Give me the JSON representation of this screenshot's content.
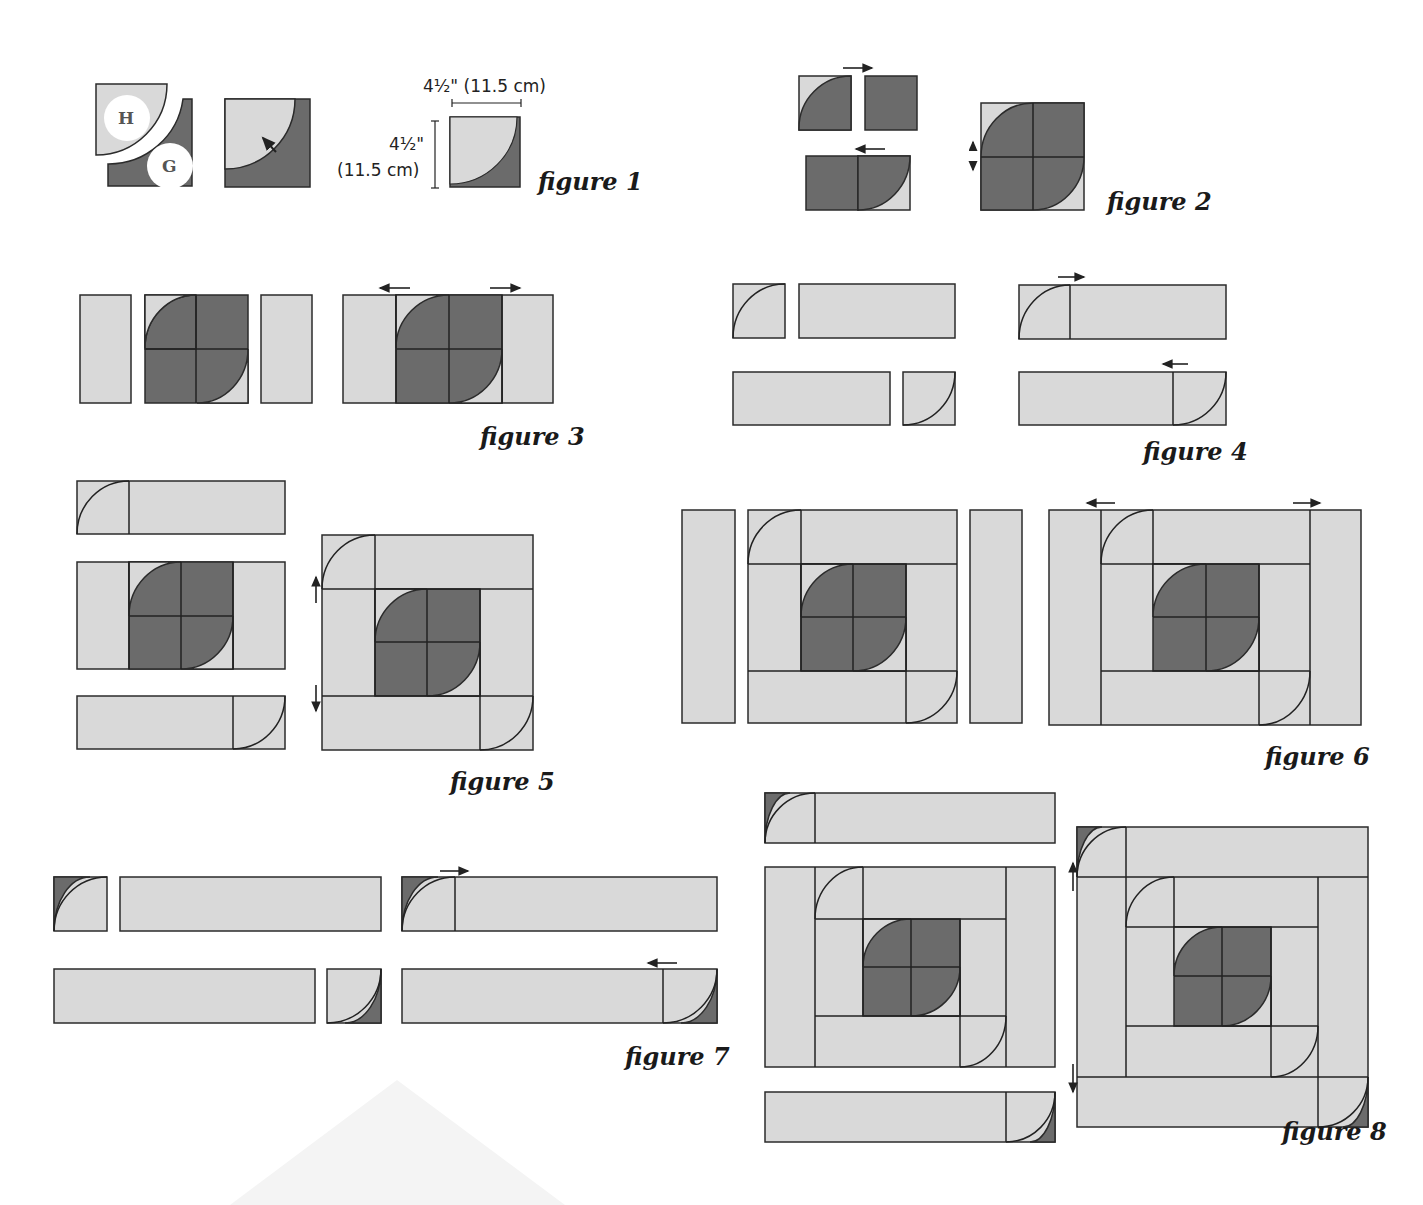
{
  "colors": {
    "light": "#d9d9d9",
    "dark": "#6b6b6b",
    "stroke": "#2b2b2b",
    "ghost": "#f4f4f4"
  },
  "figures": [
    {
      "id": "figure-1",
      "label": "figure 1",
      "label_pos": [
        538,
        190
      ],
      "dimensions": {
        "width_text": "4½\" (11.5 cm)",
        "width_text_pos": [
          423,
          92
        ],
        "height_text_line1": "4½\"",
        "height_text_line1_pos": [
          389,
          150
        ],
        "height_text_line2": "(11.5 cm)",
        "height_text_line2_pos": [
          337,
          176
        ],
        "h_bar": [
          452,
          103,
          521,
          103
        ],
        "v_bar": [
          435,
          121,
          435,
          188
        ]
      },
      "badges": [
        {
          "letter": "H",
          "cx": 127,
          "cy": 118,
          "r": 23
        },
        {
          "letter": "G",
          "cx": 170,
          "cy": 166,
          "r": 23
        }
      ]
    },
    {
      "id": "figure-2",
      "label": "figure 2",
      "label_pos": [
        1107,
        210
      ]
    },
    {
      "id": "figure-3",
      "label": "figure 3",
      "label_pos": [
        480,
        445
      ]
    },
    {
      "id": "figure-4",
      "label": "figure 4",
      "label_pos": [
        1143,
        460
      ]
    },
    {
      "id": "figure-5",
      "label": "figure 5",
      "label_pos": [
        450,
        790
      ]
    },
    {
      "id": "figure-6",
      "label": "figure 6",
      "label_pos": [
        1265,
        765
      ]
    },
    {
      "id": "figure-7",
      "label": "figure 7",
      "label_pos": [
        625,
        1065
      ]
    },
    {
      "id": "figure-8",
      "label": "figure 8",
      "label_pos": [
        1282,
        1140
      ]
    }
  ],
  "rects": [
    [
      80,
      295,
      51,
      108,
      "light"
    ],
    [
      145,
      295,
      103,
      108,
      "dark"
    ],
    [
      261,
      295,
      51,
      108,
      "light"
    ],
    [
      343,
      295,
      210,
      108,
      "light"
    ],
    [
      396,
      295,
      106,
      108,
      "dark"
    ],
    [
      733,
      284,
      52,
      54,
      "light"
    ],
    [
      799,
      284,
      156,
      54,
      "light"
    ],
    [
      1019,
      285,
      207,
      54,
      "light"
    ],
    [
      733,
      372,
      157,
      53,
      "light"
    ],
    [
      903,
      372,
      52,
      53,
      "light"
    ],
    [
      1019,
      372,
      207,
      53,
      "light"
    ],
    [
      77,
      481,
      208,
      53,
      "light"
    ],
    [
      77,
      562,
      208,
      107,
      "light"
    ],
    [
      129,
      562,
      104,
      107,
      "dark"
    ],
    [
      77,
      696,
      208,
      53,
      "light"
    ],
    [
      322,
      535,
      211,
      215,
      "light"
    ],
    [
      375,
      589,
      105,
      107,
      "dark"
    ],
    [
      682,
      510,
      53,
      213,
      "light"
    ],
    [
      748,
      510,
      209,
      213,
      "light"
    ],
    [
      801,
      564,
      105,
      107,
      "dark"
    ],
    [
      970,
      510,
      52,
      213,
      "light"
    ],
    [
      1049,
      510,
      312,
      215,
      "light"
    ],
    [
      1153,
      564,
      106,
      107,
      "dark"
    ],
    [
      54,
      877,
      53,
      54,
      "light"
    ],
    [
      120,
      877,
      261,
      54,
      "light"
    ],
    [
      402,
      877,
      315,
      54,
      "light"
    ],
    [
      54,
      969,
      261,
      54,
      "light"
    ],
    [
      327,
      969,
      54,
      54,
      "light"
    ],
    [
      402,
      969,
      315,
      54,
      "light"
    ],
    [
      765,
      793,
      290,
      50,
      "light"
    ],
    [
      765,
      867,
      290,
      200,
      "light"
    ],
    [
      863,
      919,
      97,
      97,
      "dark"
    ],
    [
      765,
      1092,
      290,
      50,
      "light"
    ],
    [
      1077,
      827,
      291,
      300,
      "light"
    ],
    [
      1174,
      927,
      97,
      99,
      "dark"
    ]
  ],
  "dark_rects_extra": [
    [
      799,
      76,
      52,
      54
    ],
    [
      865,
      76,
      52,
      54
    ],
    [
      806,
      156,
      52,
      54
    ],
    [
      858,
      156,
      52,
      54
    ],
    [
      981,
      103,
      103,
      107
    ],
    [
      225,
      99,
      85,
      88
    ],
    [
      450,
      117,
      70,
      70
    ],
    [
      107,
      99,
      85,
      88
    ]
  ],
  "lines": [
    [
      145,
      349,
      248,
      349
    ],
    [
      196,
      295,
      196,
      403
    ],
    [
      396,
      349,
      502,
      349
    ],
    [
      449,
      295,
      449,
      403
    ],
    [
      396,
      295,
      396,
      403
    ],
    [
      502,
      295,
      502,
      403
    ],
    [
      1070,
      285,
      1070,
      339
    ],
    [
      1173,
      372,
      1173,
      425
    ],
    [
      129,
      481,
      129,
      534
    ],
    [
      129,
      562,
      129,
      669
    ],
    [
      233,
      562,
      233,
      669
    ],
    [
      129,
      616,
      233,
      616
    ],
    [
      181,
      562,
      181,
      669
    ],
    [
      233,
      696,
      233,
      749
    ],
    [
      322,
      589,
      533,
      589
    ],
    [
      322,
      696,
      533,
      696
    ],
    [
      375,
      535,
      375,
      589
    ],
    [
      480,
      589,
      480,
      750
    ],
    [
      375,
      589,
      375,
      696
    ],
    [
      375,
      642,
      480,
      642
    ],
    [
      427,
      589,
      427,
      696
    ],
    [
      748,
      564,
      957,
      564
    ],
    [
      748,
      671,
      957,
      671
    ],
    [
      801,
      510,
      801,
      564
    ],
    [
      906,
      564,
      906,
      723
    ],
    [
      801,
      564,
      801,
      671
    ],
    [
      801,
      617,
      906,
      617
    ],
    [
      853,
      564,
      853,
      671
    ],
    [
      1101,
      510,
      1101,
      725
    ],
    [
      1310,
      510,
      1310,
      725
    ],
    [
      1101,
      564,
      1310,
      564
    ],
    [
      1101,
      671,
      1310,
      671
    ],
    [
      1153,
      510,
      1153,
      564
    ],
    [
      1259,
      564,
      1259,
      725
    ],
    [
      1153,
      617,
      1259,
      617
    ],
    [
      1206,
      564,
      1206,
      671
    ],
    [
      455,
      877,
      455,
      931
    ],
    [
      663,
      969,
      663,
      1023
    ],
    [
      815,
      793,
      815,
      843
    ],
    [
      815,
      867,
      815,
      1067
    ],
    [
      1006,
      867,
      1006,
      1067
    ],
    [
      815,
      919,
      1006,
      919
    ],
    [
      815,
      1016,
      1006,
      1016
    ],
    [
      863,
      867,
      863,
      919
    ],
    [
      960,
      919,
      960,
      1067
    ],
    [
      863,
      919,
      863,
      1016
    ],
    [
      863,
      967,
      960,
      967
    ],
    [
      911,
      919,
      911,
      1016
    ],
    [
      1006,
      1092,
      1006,
      1142
    ],
    [
      1077,
      877,
      1368,
      877
    ],
    [
      1077,
      1077,
      1368,
      1077
    ],
    [
      1126,
      827,
      1126,
      877
    ],
    [
      1126,
      877,
      1126,
      1077
    ],
    [
      1318,
      877,
      1318,
      1127
    ],
    [
      1126,
      927,
      1318,
      927
    ],
    [
      1126,
      1026,
      1318,
      1026
    ],
    [
      1174,
      877,
      1174,
      927
    ],
    [
      1271,
      927,
      1271,
      1077
    ],
    [
      1174,
      976,
      1271,
      976
    ],
    [
      1222,
      927,
      1222,
      1026
    ]
  ],
  "arrows": [
    {
      "x1": 843,
      "y1": 68,
      "x2": 872,
      "y2": 68
    },
    {
      "x1": 885,
      "y1": 149,
      "x2": 856,
      "y2": 149
    },
    {
      "x1": 410,
      "y1": 288,
      "x2": 380,
      "y2": 288
    },
    {
      "x1": 490,
      "y1": 288,
      "x2": 520,
      "y2": 288
    },
    {
      "x1": 1058,
      "y1": 277,
      "x2": 1084,
      "y2": 277
    },
    {
      "x1": 1188,
      "y1": 364,
      "x2": 1163,
      "y2": 364
    },
    {
      "x1": 316,
      "y1": 603,
      "x2": 316,
      "y2": 577
    },
    {
      "x1": 316,
      "y1": 685,
      "x2": 316,
      "y2": 711
    },
    {
      "x1": 1115,
      "y1": 503,
      "x2": 1087,
      "y2": 503
    },
    {
      "x1": 1293,
      "y1": 503,
      "x2": 1320,
      "y2": 503
    },
    {
      "x1": 440,
      "y1": 871,
      "x2": 468,
      "y2": 871
    },
    {
      "x1": 677,
      "y1": 963,
      "x2": 648,
      "y2": 963
    },
    {
      "x1": 1073,
      "y1": 891,
      "x2": 1073,
      "y2": 863
    },
    {
      "x1": 1073,
      "y1": 1064,
      "x2": 1073,
      "y2": 1092
    }
  ],
  "ghost_triangle": [
    [
      230,
      1205
    ],
    [
      397,
      1080
    ],
    [
      565,
      1205
    ]
  ]
}
